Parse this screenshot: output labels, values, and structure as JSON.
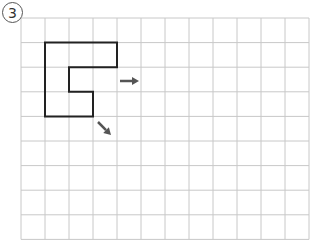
{
  "problem": {
    "number_label": "3"
  },
  "grid": {
    "columns": 12,
    "rows": 9,
    "left": 21,
    "top": 18,
    "cell_w": 24,
    "cell_h": 24.6,
    "line_color": "#c8c8c8"
  },
  "shape": {
    "stroke": "#222222",
    "points_cells": [
      [
        1,
        1
      ],
      [
        4,
        1
      ],
      [
        4,
        2
      ],
      [
        2,
        2
      ],
      [
        2,
        3
      ],
      [
        3,
        3
      ],
      [
        3,
        4
      ],
      [
        1,
        4
      ]
    ]
  },
  "arrows": [
    {
      "name": "arrow-right-icon",
      "direction": "right",
      "from": [
        120,
        81
      ],
      "to": [
        139,
        81
      ]
    },
    {
      "name": "arrow-down-right-icon",
      "direction": "down-right",
      "from": [
        98,
        122
      ],
      "to": [
        111,
        135
      ]
    }
  ],
  "colors": {
    "arrow": "#555555"
  }
}
